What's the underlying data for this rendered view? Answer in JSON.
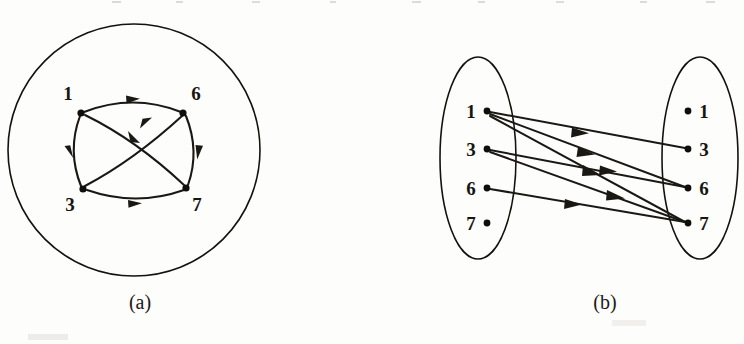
{
  "figure": {
    "background_color": "#fdfdfc",
    "ink_color": "#1a1813",
    "panels": [
      {
        "id": "a",
        "caption": "(a)",
        "caption_x": 140,
        "caption_y": 309,
        "kind": "circular-digraph",
        "enclosure": {
          "shape": "circle",
          "cx": 134,
          "cy": 150,
          "r": 126
        },
        "nodes": [
          {
            "id": "1",
            "label": "1",
            "x": 81,
            "y": 113,
            "label_x": 68,
            "label_y": 100,
            "r": 3.6
          },
          {
            "id": "6",
            "label": "6",
            "x": 183,
            "y": 113,
            "label_x": 192,
            "label_y": 100,
            "r": 3.6
          },
          {
            "id": "3",
            "label": "3",
            "x": 83,
            "y": 189,
            "label_x": 68,
            "label_y": 209,
            "r": 3.6
          },
          {
            "id": "7",
            "label": "7",
            "x": 186,
            "y": 188,
            "label_x": 193,
            "label_y": 209,
            "r": 3.6
          }
        ],
        "edges": [
          {
            "from": "1",
            "to": "6",
            "style": "arc-top"
          },
          {
            "from": "1",
            "to": "3",
            "style": "arc-left"
          },
          {
            "from": "1",
            "to": "7",
            "style": "diagonal-down"
          },
          {
            "from": "3",
            "to": "6",
            "style": "diagonal-up"
          },
          {
            "from": "3",
            "to": "7",
            "style": "arc-bottom"
          },
          {
            "from": "6",
            "to": "7",
            "style": "arc-right"
          }
        ]
      },
      {
        "id": "b",
        "caption": "(b)",
        "caption_x": 605,
        "caption_y": 309,
        "kind": "bipartite-digraph",
        "left_enclosure": {
          "shape": "ellipse",
          "cx": 478,
          "cy": 158,
          "rx": 38,
          "ry": 101
        },
        "right_enclosure": {
          "shape": "ellipse",
          "cx": 700,
          "cy": 158,
          "rx": 38,
          "ry": 101
        },
        "left_nodes": [
          {
            "id": "L1",
            "label": "1",
            "x": 487,
            "y": 111,
            "label_x": 472,
            "label_y": 118,
            "r": 3.4
          },
          {
            "id": "L3",
            "label": "3",
            "x": 487,
            "y": 149,
            "label_x": 472,
            "label_y": 156,
            "r": 3.4
          },
          {
            "id": "L6",
            "label": "6",
            "x": 487,
            "y": 188,
            "label_x": 472,
            "label_y": 195,
            "r": 3.4
          },
          {
            "id": "L7",
            "label": "7",
            "x": 487,
            "y": 223,
            "label_x": 472,
            "label_y": 230,
            "r": 3.4
          }
        ],
        "right_nodes": [
          {
            "id": "R1",
            "label": "1",
            "x": 688,
            "y": 111,
            "label_x": 700,
            "label_y": 118,
            "r": 3.4
          },
          {
            "id": "R3",
            "label": "3",
            "x": 688,
            "y": 149,
            "label_x": 700,
            "label_y": 156,
            "r": 3.4
          },
          {
            "id": "R6",
            "label": "6",
            "x": 688,
            "y": 188,
            "label_x": 700,
            "label_y": 195,
            "r": 3.4
          },
          {
            "id": "R7",
            "label": "7",
            "x": 688,
            "y": 223,
            "label_x": 700,
            "label_y": 230,
            "r": 3.4
          }
        ],
        "edges": [
          {
            "from": "L1",
            "to": "R3"
          },
          {
            "from": "L1",
            "to": "R6"
          },
          {
            "from": "L1",
            "to": "R7"
          },
          {
            "from": "L3",
            "to": "R6"
          },
          {
            "from": "L3",
            "to": "R7"
          },
          {
            "from": "L6",
            "to": "R7"
          }
        ]
      }
    ]
  },
  "graph_data": {
    "type": "directed-graph",
    "vertices": [
      "1",
      "3",
      "6",
      "7"
    ],
    "edges": [
      [
        "1",
        "3"
      ],
      [
        "1",
        "6"
      ],
      [
        "1",
        "7"
      ],
      [
        "3",
        "6"
      ],
      [
        "3",
        "7"
      ],
      [
        "6",
        "7"
      ]
    ],
    "edge_count": 6,
    "out_degrees": {
      "1": 3,
      "3": 2,
      "6": 1,
      "7": 0
    },
    "in_degrees": {
      "1": 0,
      "3": 1,
      "6": 2,
      "7": 3
    }
  },
  "labels": {
    "n1": "1",
    "n3": "3",
    "n6": "6",
    "n7": "7",
    "caption_a": "(a)",
    "caption_b": "(b)"
  }
}
